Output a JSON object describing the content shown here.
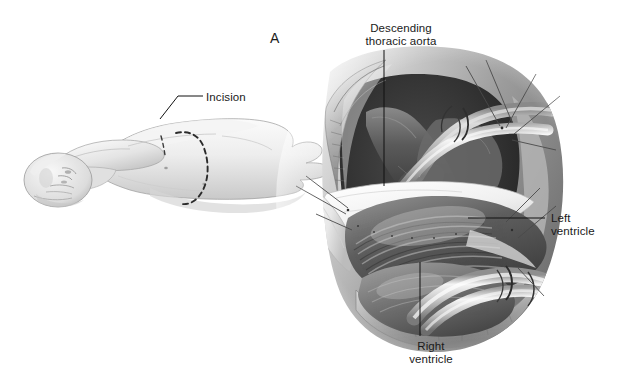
{
  "figure": {
    "panel_letter": "A",
    "background_color": "#ffffff",
    "text_color": "#1a1a1a",
    "style": "grayscale medical line-and-wash illustration"
  },
  "labels": [
    {
      "key": "incision",
      "text": "Incision",
      "align": "left",
      "x": 206,
      "y": 91,
      "leader": "angled line from text down-left to dashed incision line on chest"
    },
    {
      "key": "descending_thoracic_aorta",
      "text": "Descending\nthoracic aorta",
      "align": "center",
      "x": 355,
      "y": 22,
      "leader": "vertical line down to aorta in surgical field"
    },
    {
      "key": "left_ventricle",
      "text": "Left\nventricle",
      "align": "left",
      "x": 551,
      "y": 212,
      "leader": "horizontal line left to left ventricle surface"
    },
    {
      "key": "right_ventricle",
      "text": "Right\nventricle",
      "align": "center",
      "x": 400,
      "y": 340,
      "leader": "vertical line up to right ventricle"
    }
  ],
  "scene_left": {
    "name": "patient-position-illustration",
    "description": "Patient in right lateral decubitus position, torso and head visible, left arm raised over head",
    "incision_line_style": "dashed",
    "incision_line_color": "#2b2b2b"
  },
  "scene_right": {
    "name": "thoracotomy-surgical-field",
    "description": "Left thoracotomy exposure showing chest wall with ribs, retracted pericardium, descending thoracic aorta with cannula, left ventricle, right ventricle and second cannula",
    "elements": [
      "chest-wall-ribs",
      "pericardial-flap",
      "retraction-sutures",
      "aortic-cannula",
      "apical-cannula",
      "descending-thoracic-aorta",
      "left-ventricle",
      "right-ventricle"
    ]
  }
}
